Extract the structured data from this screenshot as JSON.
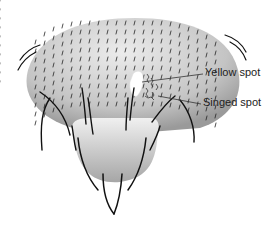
{
  "diagram": {
    "labels": {
      "yellow_spot": "Yellow spot",
      "singed_spot": "Singed spot"
    },
    "colors": {
      "body_light": "#e6e6e6",
      "body_dark": "#9a9a9a",
      "bristle": "#111111",
      "yellow_spot": "#ffffff"
    }
  }
}
